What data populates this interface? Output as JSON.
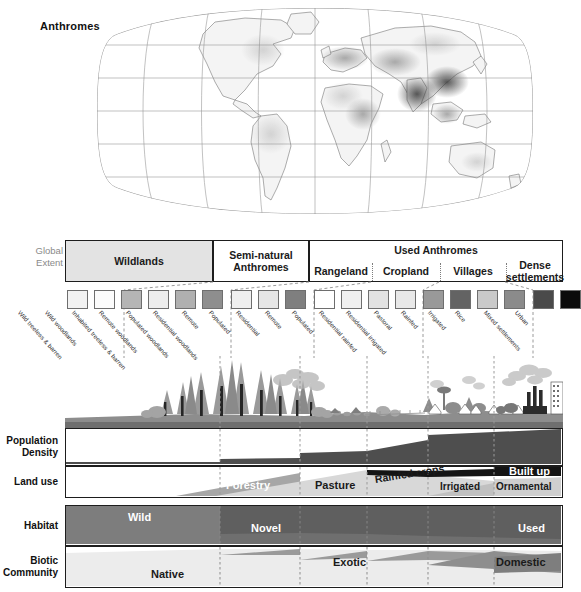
{
  "map": {
    "title": "Anthromes",
    "projection": "robinson-graticule",
    "legend_note": ""
  },
  "extent": {
    "row_label_line1": "Global",
    "row_label_line2": "Extent",
    "groups": [
      {
        "label": "Wildlands",
        "shaded": true,
        "x": 0,
        "w": 148
      },
      {
        "label": "Semi-natural\nAnthromes",
        "shaded": false,
        "x": 148,
        "w": 96
      },
      {
        "label": "Used Anthromes",
        "shaded": false,
        "x": 244,
        "w": 254
      }
    ],
    "used_title": "Used Anthromes",
    "used_sub": [
      {
        "label": "Rangeland",
        "x": 0,
        "w": 62
      },
      {
        "label": "Cropland",
        "x": 62,
        "w": 68
      },
      {
        "label": "Villages",
        "x": 130,
        "w": 66
      },
      {
        "label": "Dense\nsettlements",
        "x": 196,
        "w": 58
      }
    ]
  },
  "swatches": [
    {
      "name": "Wild treeless & barren",
      "color": "#f2f2f2",
      "x": 2,
      "w": 21
    },
    {
      "name": "Wild woodlands",
      "color": "#fcfcfc",
      "x": 29,
      "w": 21
    },
    {
      "name": "Inhabited treeless & barren",
      "color": "#b5b5b5",
      "x": 56,
      "w": 21
    },
    {
      "name": "Remote woodlands",
      "color": "#ededed",
      "x": 83,
      "w": 21
    },
    {
      "name": "Populated woodlands",
      "color": "#b0b0b0",
      "x": 110,
      "w": 21
    },
    {
      "name": "Residential woodlands",
      "color": "#8e8e8e",
      "x": 137,
      "w": 21
    },
    {
      "name": "Remote",
      "color": "#efefef",
      "x": 166,
      "w": 21
    },
    {
      "name": "Populated",
      "color": "#e6e6e6",
      "x": 193,
      "w": 21
    },
    {
      "name": "Residential",
      "color": "#7f7f7f",
      "x": 220,
      "w": 21
    },
    {
      "name": "Remote",
      "color": "#ffffff",
      "x": 249,
      "w": 21
    },
    {
      "name": "Populated",
      "color": "#f0f0f0",
      "x": 276,
      "w": 21
    },
    {
      "name": "Residential rainfed",
      "color": "#e2e2e2",
      "x": 303,
      "w": 21
    },
    {
      "name": "Residential irrigated",
      "color": "#e8e8e8",
      "x": 330,
      "w": 21
    },
    {
      "name": "Pastoral",
      "color": "#999999",
      "x": 358,
      "w": 21
    },
    {
      "name": "Rainfed",
      "color": "#636363",
      "x": 385,
      "w": 21
    },
    {
      "name": "Irrigated",
      "color": "#c9c9c9",
      "x": 412,
      "w": 21
    },
    {
      "name": "Rice",
      "color": "#8b8b8b",
      "x": 439,
      "w": 21
    },
    {
      "name": "Mixed settlements",
      "color": "#4a4a4a",
      "x": 468,
      "w": 21
    },
    {
      "name": "Urban",
      "color": "#0b0b0b",
      "x": 495,
      "w": 21
    }
  ],
  "rows": [
    {
      "key": "popdens",
      "label_line1": "Population",
      "label_line2": "Density"
    },
    {
      "key": "landuse",
      "label_line1": "Land use",
      "label_line2": ""
    },
    {
      "key": "habitat",
      "label_line1": "Habitat",
      "label_line2": ""
    },
    {
      "key": "biotic",
      "label_line1": "Biotic",
      "label_line2": "Community"
    }
  ],
  "landuse_bands": [
    {
      "label": "Forestry",
      "color": "#ffffff"
    },
    {
      "label": "Pasture",
      "color": "#1a1a1a"
    },
    {
      "label": "Rainfed crops",
      "color": "#1a1a1a"
    },
    {
      "label": "Irrigated",
      "color": "#1a1a1a"
    },
    {
      "label": "Built up",
      "color": "#ffffff"
    },
    {
      "label": "Ornamental",
      "color": "#1a1a1a"
    }
  ],
  "habitat_bands": [
    {
      "label": "Wild",
      "color": "#ffffff"
    },
    {
      "label": "Novel",
      "color": "#ffffff"
    },
    {
      "label": "Used",
      "color": "#ffffff"
    }
  ],
  "biotic_bands": [
    {
      "label": "Native",
      "color": "#1a1a1a"
    },
    {
      "label": "Exotic",
      "color": "#1a1a1a"
    },
    {
      "label": "Domestic",
      "color": "#1a1a1a"
    }
  ],
  "colors": {
    "frame": "#1d1d1d",
    "divider": "#8c8c8c",
    "shaded_header": "#e3e3e3",
    "dark_fill": "#555555",
    "mid_fill": "#9a9a9a",
    "light_fill": "#e9e9e9",
    "label_grey": "#8a8a8a"
  },
  "dividers_pct": [
    31.1,
    47.2,
    60.7,
    73.0,
    86.1
  ]
}
